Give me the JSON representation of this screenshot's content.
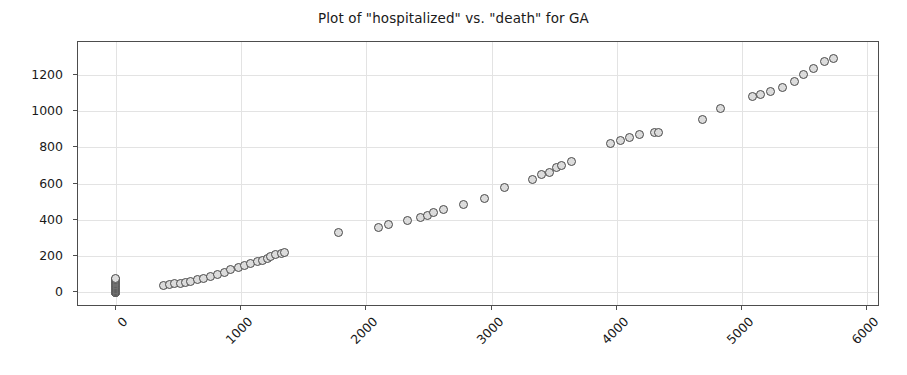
{
  "chart_data": {
    "type": "scatter",
    "title": "Plot of \"hospitalized\" vs. \"death\" for GA",
    "xlabel": "",
    "ylabel": "",
    "xlim": [
      -300,
      6100
    ],
    "ylim": [
      -80,
      1380
    ],
    "xticks": [
      0,
      1000,
      2000,
      3000,
      4000,
      5000,
      6000
    ],
    "yticks": [
      0,
      200,
      400,
      600,
      800,
      1000,
      1200
    ],
    "xticklabels": [
      "0",
      "1000",
      "2000",
      "3000",
      "4000",
      "5000",
      "6000"
    ],
    "yticklabels": [
      "0",
      "200",
      "400",
      "600",
      "800",
      "1000",
      "1200"
    ],
    "grid": true,
    "legend": null,
    "xtick_rotation": -45,
    "marker": {
      "shape": "circle",
      "size": 9,
      "facecolor": "#dcdcdc",
      "edgecolor": "#4a4a4a"
    },
    "series": [
      {
        "name": "hospitalized vs death",
        "points": [
          [
            0,
            0
          ],
          [
            0,
            0
          ],
          [
            0,
            0
          ],
          [
            0,
            1
          ],
          [
            0,
            2
          ],
          [
            0,
            3
          ],
          [
            0,
            4
          ],
          [
            0,
            6
          ],
          [
            0,
            10
          ],
          [
            0,
            13
          ],
          [
            0,
            17
          ],
          [
            0,
            20
          ],
          [
            0,
            23
          ],
          [
            0,
            25
          ],
          [
            0,
            27
          ],
          [
            0,
            31
          ],
          [
            0,
            34
          ],
          [
            0,
            38
          ],
          [
            0,
            41
          ],
          [
            0,
            45
          ],
          [
            0,
            48
          ],
          [
            0,
            52
          ],
          [
            0,
            56
          ],
          [
            0,
            60
          ],
          [
            0,
            64
          ],
          [
            0,
            69
          ],
          [
            0,
            74
          ],
          [
            0,
            79
          ],
          [
            380,
            38
          ],
          [
            430,
            42
          ],
          [
            470,
            47
          ],
          [
            520,
            50
          ],
          [
            560,
            55
          ],
          [
            600,
            62
          ],
          [
            650,
            70
          ],
          [
            700,
            75
          ],
          [
            760,
            87
          ],
          [
            810,
            97
          ],
          [
            870,
            110
          ],
          [
            920,
            125
          ],
          [
            980,
            136
          ],
          [
            1030,
            147
          ],
          [
            1080,
            157
          ],
          [
            1130,
            172
          ],
          [
            1170,
            178
          ],
          [
            1210,
            188
          ],
          [
            1240,
            197
          ],
          [
            1280,
            207
          ],
          [
            1320,
            216
          ],
          [
            1350,
            222
          ],
          [
            1780,
            330
          ],
          [
            2100,
            357
          ],
          [
            2180,
            372
          ],
          [
            2330,
            396
          ],
          [
            2430,
            415
          ],
          [
            2490,
            423
          ],
          [
            2540,
            440
          ],
          [
            2620,
            456
          ],
          [
            2780,
            487
          ],
          [
            2940,
            520
          ],
          [
            3100,
            577
          ],
          [
            3330,
            625
          ],
          [
            3400,
            650
          ],
          [
            3460,
            660
          ],
          [
            3520,
            690
          ],
          [
            3560,
            702
          ],
          [
            3640,
            722
          ],
          [
            3950,
            820
          ],
          [
            4030,
            840
          ],
          [
            4100,
            855
          ],
          [
            4180,
            868
          ],
          [
            4300,
            880
          ],
          [
            4330,
            884
          ],
          [
            4680,
            952
          ],
          [
            4830,
            1015
          ],
          [
            5080,
            1080
          ],
          [
            5150,
            1092
          ],
          [
            5230,
            1110
          ],
          [
            5320,
            1132
          ],
          [
            5420,
            1163
          ],
          [
            5490,
            1200
          ],
          [
            5570,
            1232
          ],
          [
            5660,
            1275
          ],
          [
            5730,
            1288
          ]
        ]
      }
    ]
  }
}
